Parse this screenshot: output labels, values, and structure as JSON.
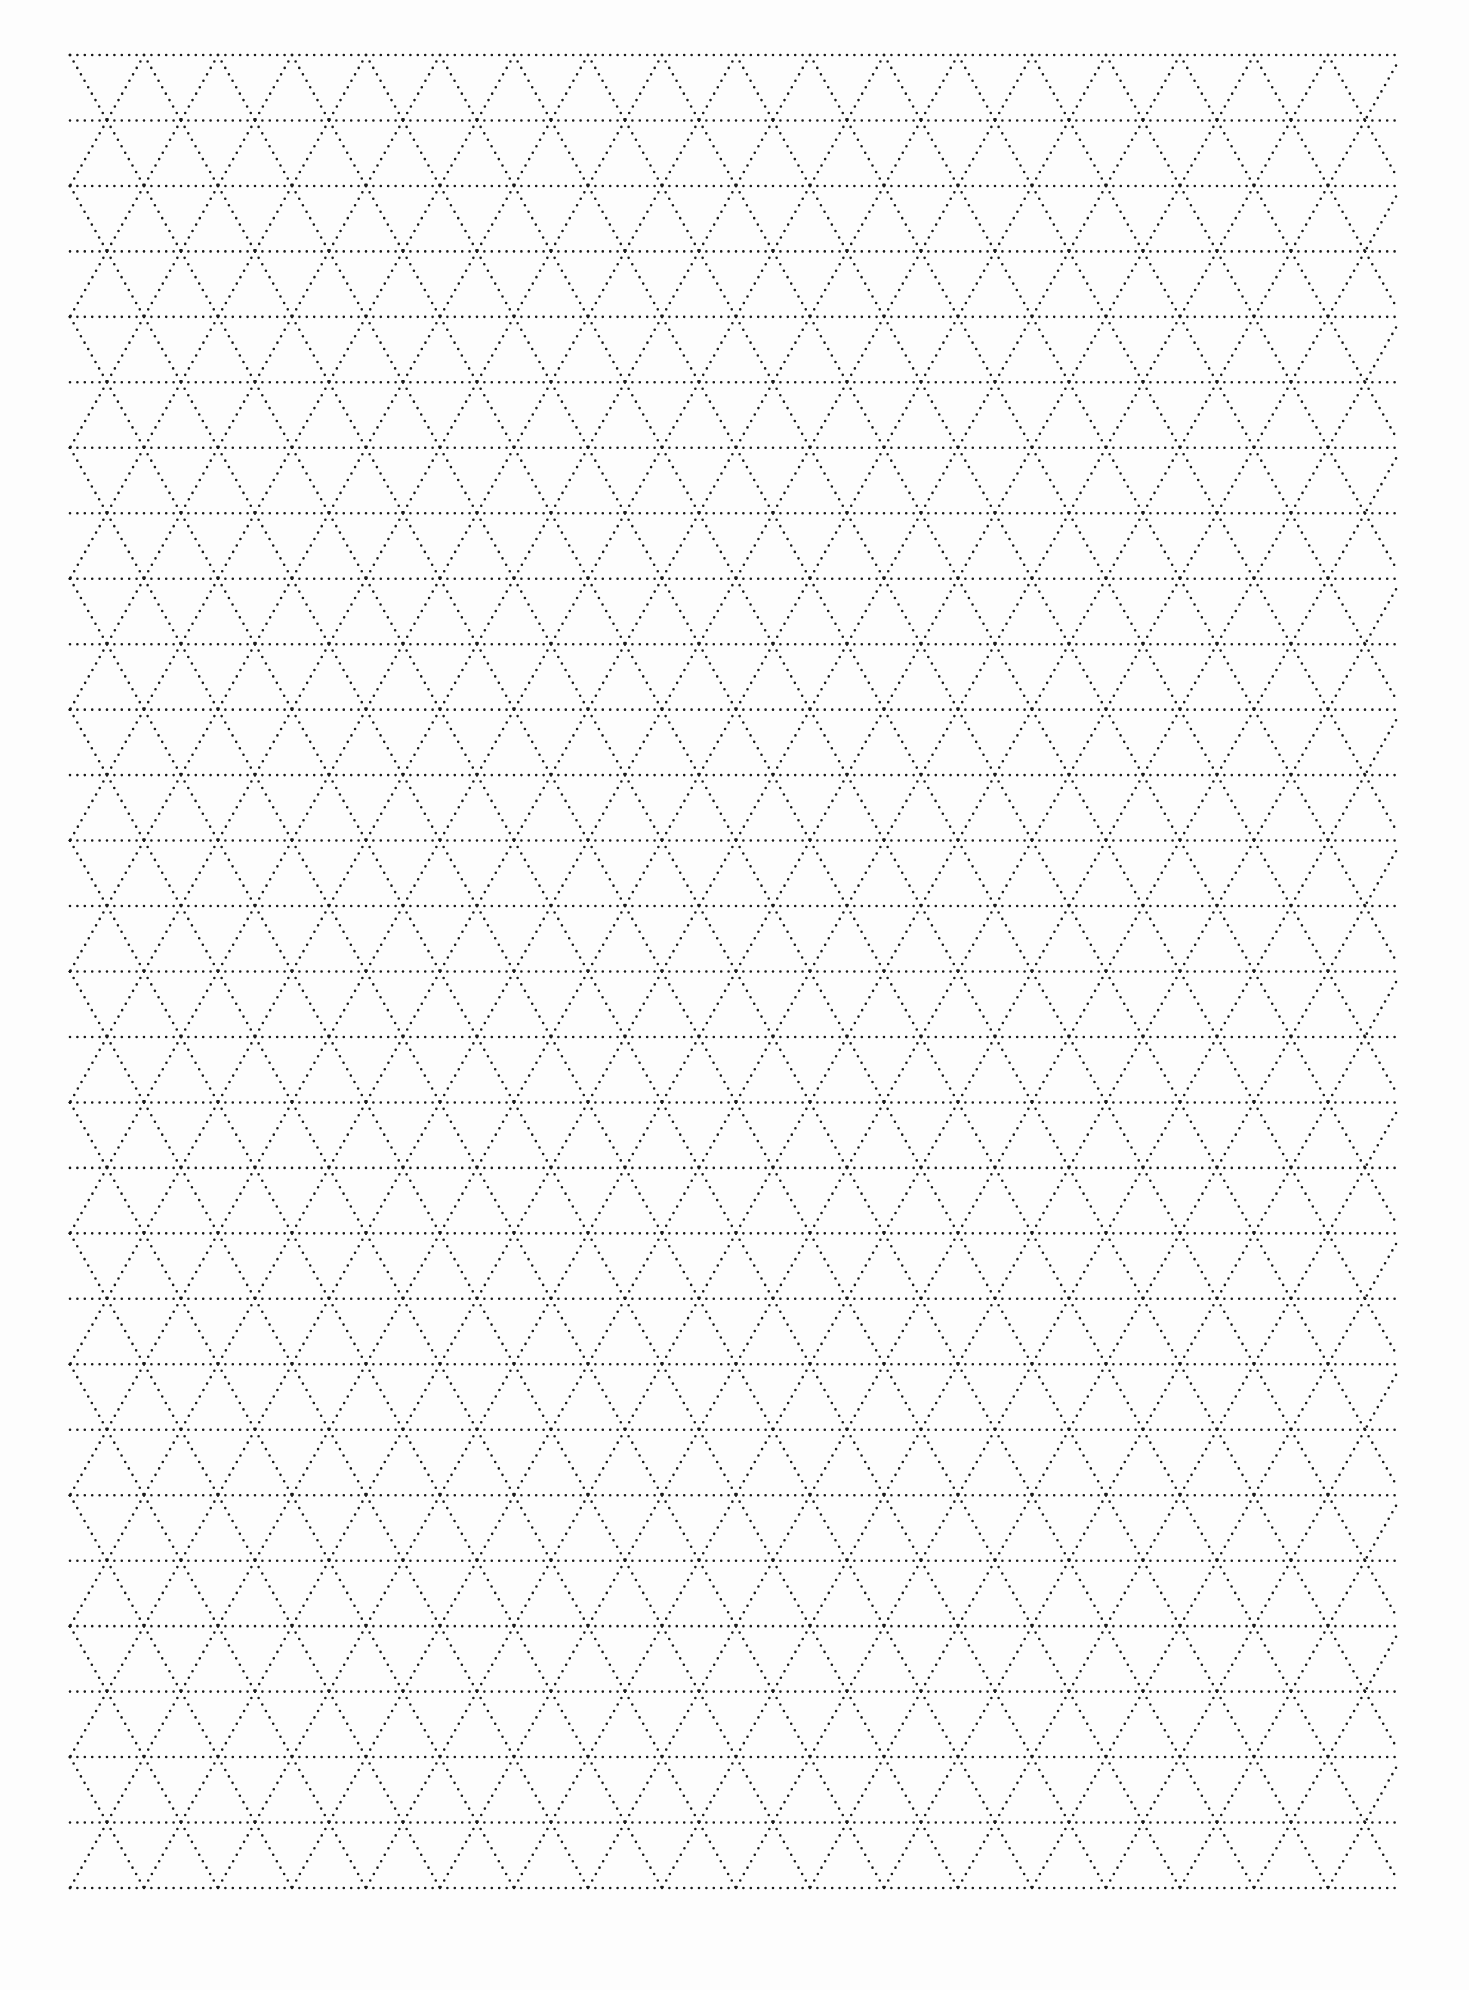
{
  "page": {
    "type": "triangular-dot-grid-paper",
    "background": "#fdfdfd",
    "line_color": "#1a1a1a"
  },
  "grid": {
    "left": 70,
    "right": 1396,
    "top": 55,
    "bottom": 1888,
    "rows": 28,
    "triangle_width": 74,
    "dot_size": 2.6,
    "dot_gap": 7.4
  }
}
